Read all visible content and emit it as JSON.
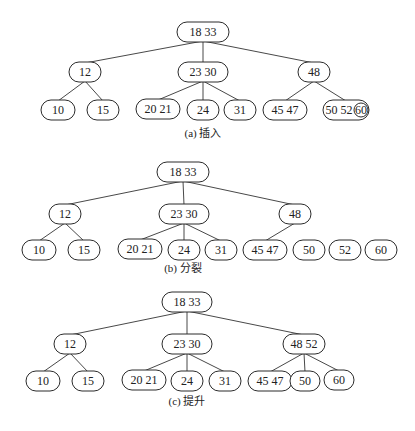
{
  "diagram": {
    "panels": [
      {
        "id": "a",
        "caption": "(a) 插入",
        "nodes": [
          {
            "id": "root",
            "label": "18  33",
            "x": 203,
            "y": 32,
            "w": 52
          },
          {
            "id": "n12",
            "label": "12",
            "x": 85,
            "y": 72,
            "w": 32
          },
          {
            "id": "n2330",
            "label": "23   30",
            "x": 203,
            "y": 72,
            "w": 50
          },
          {
            "id": "n48",
            "label": "48",
            "x": 314,
            "y": 72,
            "w": 32
          },
          {
            "id": "n10",
            "label": "10",
            "x": 58,
            "y": 110,
            "w": 34
          },
          {
            "id": "n15",
            "label": "15",
            "x": 103,
            "y": 110,
            "w": 32
          },
          {
            "id": "n2021",
            "label": "20   21",
            "x": 158,
            "y": 109,
            "w": 44
          },
          {
            "id": "n24",
            "label": "24",
            "x": 203,
            "y": 110,
            "w": 32
          },
          {
            "id": "n31",
            "label": "31",
            "x": 240,
            "y": 110,
            "w": 32
          },
          {
            "id": "n4547",
            "label": "45  47",
            "x": 285,
            "y": 110,
            "w": 44
          },
          {
            "id": "n505260",
            "label": "50 52",
            "x": 346,
            "y": 110,
            "w": 46,
            "highlight": "60"
          }
        ],
        "edges": [
          [
            "root",
            "n12"
          ],
          [
            "root",
            "n2330"
          ],
          [
            "root",
            "n48"
          ],
          [
            "n12",
            "n10"
          ],
          [
            "n12",
            "n15"
          ],
          [
            "n2330",
            "n2021"
          ],
          [
            "n2330",
            "n24"
          ],
          [
            "n2330",
            "n31"
          ],
          [
            "n48",
            "n4547"
          ],
          [
            "n48",
            "n505260"
          ]
        ],
        "caption_y": 137
      },
      {
        "id": "b",
        "caption": "(b) 分裂",
        "nodes": [
          {
            "id": "root",
            "label": "18  33",
            "x": 183,
            "y": 172,
            "w": 52
          },
          {
            "id": "n12",
            "label": "12",
            "x": 65,
            "y": 214,
            "w": 32
          },
          {
            "id": "n2330",
            "label": "23   30",
            "x": 184,
            "y": 214,
            "w": 50
          },
          {
            "id": "n48",
            "label": "48",
            "x": 295,
            "y": 214,
            "w": 32
          },
          {
            "id": "n10",
            "label": "10",
            "x": 39,
            "y": 250,
            "w": 34
          },
          {
            "id": "n15",
            "label": "15",
            "x": 84,
            "y": 250,
            "w": 32
          },
          {
            "id": "n2021",
            "label": "20   21",
            "x": 140,
            "y": 249,
            "w": 44
          },
          {
            "id": "n24",
            "label": "24",
            "x": 184,
            "y": 250,
            "w": 32
          },
          {
            "id": "n31",
            "label": "31",
            "x": 221,
            "y": 250,
            "w": 32
          },
          {
            "id": "n4547",
            "label": "45  47",
            "x": 265,
            "y": 250,
            "w": 44
          },
          {
            "id": "n50",
            "label": "50",
            "x": 309,
            "y": 250,
            "w": 32
          },
          {
            "id": "n52",
            "label": "52",
            "x": 345,
            "y": 250,
            "w": 32
          },
          {
            "id": "n60",
            "label": "60",
            "x": 381,
            "y": 250,
            "w": 32
          }
        ],
        "edges": [
          [
            "root",
            "n12"
          ],
          [
            "root",
            "n2330"
          ],
          [
            "root",
            "n48"
          ],
          [
            "n12",
            "n10"
          ],
          [
            "n12",
            "n15"
          ],
          [
            "n2330",
            "n2021"
          ],
          [
            "n2330",
            "n24"
          ],
          [
            "n2330",
            "n31"
          ],
          [
            "n48",
            "n4547"
          ]
        ],
        "caption_y": 272
      },
      {
        "id": "c",
        "caption": "(c) 提升",
        "nodes": [
          {
            "id": "root",
            "label": "18  33",
            "x": 187,
            "y": 302,
            "w": 50
          },
          {
            "id": "n12",
            "label": "12",
            "x": 70,
            "y": 344,
            "w": 32
          },
          {
            "id": "n2330",
            "label": "23   30",
            "x": 187,
            "y": 344,
            "w": 50
          },
          {
            "id": "n4852",
            "label": "48  52",
            "x": 304,
            "y": 344,
            "w": 42
          },
          {
            "id": "n10",
            "label": "10",
            "x": 43,
            "y": 381,
            "w": 34
          },
          {
            "id": "n15",
            "label": "15",
            "x": 88,
            "y": 381,
            "w": 32
          },
          {
            "id": "n2021",
            "label": "20   21",
            "x": 144,
            "y": 380,
            "w": 44
          },
          {
            "id": "n24",
            "label": "24",
            "x": 187,
            "y": 381,
            "w": 32
          },
          {
            "id": "n31",
            "label": "31",
            "x": 225,
            "y": 381,
            "w": 32
          },
          {
            "id": "n4547",
            "label": "45  47",
            "x": 270,
            "y": 381,
            "w": 44
          },
          {
            "id": "n50",
            "label": "50",
            "x": 305,
            "y": 381,
            "w": 30
          },
          {
            "id": "n60",
            "label": "60",
            "x": 339,
            "y": 380,
            "w": 30
          }
        ],
        "edges": [
          [
            "root",
            "n12"
          ],
          [
            "root",
            "n2330"
          ],
          [
            "root",
            "n4852"
          ],
          [
            "n12",
            "n10"
          ],
          [
            "n12",
            "n15"
          ],
          [
            "n2330",
            "n2021"
          ],
          [
            "n2330",
            "n24"
          ],
          [
            "n2330",
            "n31"
          ],
          [
            "n4852",
            "n4547"
          ],
          [
            "n4852",
            "n50"
          ],
          [
            "n4852",
            "n60"
          ]
        ],
        "caption_y": 405
      }
    ]
  }
}
